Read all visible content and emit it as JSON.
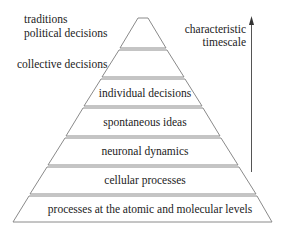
{
  "diagram": {
    "type": "pyramid",
    "top_labels": {
      "line1": "traditions",
      "line2": "political decisions",
      "collective": "collective decisions"
    },
    "layers": [
      {
        "label": "individual decisions"
      },
      {
        "label": "spontaneous ideas"
      },
      {
        "label": "neuronal dynamics"
      },
      {
        "label": "cellular processes"
      },
      {
        "label": "processes at the atomic and molecular levels"
      }
    ],
    "axis": {
      "label_line1": "characteristic",
      "label_line2": "timescale",
      "direction": "up"
    },
    "colors": {
      "line": "#8a8a8a",
      "arrow": "#555555",
      "text": "#222222"
    }
  }
}
